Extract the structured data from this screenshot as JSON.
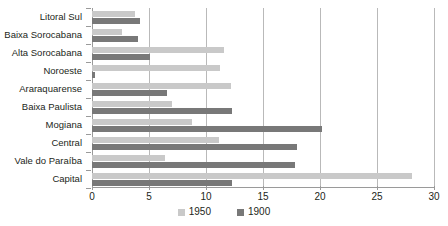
{
  "chart_data": {
    "type": "bar",
    "orientation": "horizontal",
    "title": "",
    "xlabel": "",
    "ylabel": "",
    "xlim": [
      0,
      30
    ],
    "xticks": [
      0,
      5,
      10,
      15,
      20,
      25,
      30
    ],
    "grid": true,
    "legend_position": "bottom",
    "categories": [
      "Litoral Sul",
      "Baixa Sorocabana",
      "Alta Sorocabana",
      "Noroeste",
      "Araraquarense",
      "Baixa Paulista",
      "Mogiana",
      "Central",
      "Vale do Paraíba",
      "Capital"
    ],
    "series": [
      {
        "name": "1950",
        "color": "#c9c9c9",
        "values": [
          3.8,
          2.6,
          11.6,
          11.2,
          12.2,
          7.0,
          8.8,
          11.1,
          6.4,
          28.1
        ]
      },
      {
        "name": "1900",
        "color": "#787878",
        "values": [
          4.2,
          4.0,
          5.1,
          0.3,
          6.6,
          12.3,
          20.2,
          18.0,
          17.8,
          12.3
        ]
      }
    ]
  },
  "axis": {
    "tick_labels": [
      "0",
      "5",
      "10",
      "15",
      "20",
      "25",
      "30"
    ]
  },
  "legend": {
    "items": [
      {
        "label": "1950"
      },
      {
        "label": "1900"
      }
    ]
  },
  "colors": {
    "series_1950": "#c9c9c9",
    "series_1900": "#787878",
    "gridline": "#b9b9b9",
    "axis": "#9a9a9a",
    "text": "#231f20",
    "background": "#ffffff"
  }
}
